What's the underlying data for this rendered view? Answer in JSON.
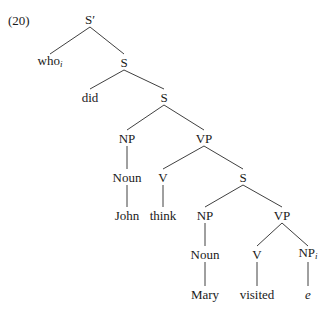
{
  "example_number": "(20)",
  "tree": {
    "nodes": [
      {
        "id": "n0",
        "label": "S′",
        "sub": "",
        "italic": false,
        "x": 90,
        "y": 19
      },
      {
        "id": "n1",
        "label": "who",
        "sub": "i",
        "italic": false,
        "x": 50,
        "y": 62
      },
      {
        "id": "n2",
        "label": "S",
        "sub": "",
        "italic": false,
        "x": 124,
        "y": 62
      },
      {
        "id": "n3",
        "label": "did",
        "sub": "",
        "italic": false,
        "x": 90,
        "y": 97
      },
      {
        "id": "n4",
        "label": "S",
        "sub": "",
        "italic": false,
        "x": 164,
        "y": 97
      },
      {
        "id": "n5",
        "label": "NP",
        "sub": "",
        "italic": false,
        "x": 127,
        "y": 138
      },
      {
        "id": "n6",
        "label": "VP",
        "sub": "",
        "italic": false,
        "x": 204,
        "y": 138
      },
      {
        "id": "n7",
        "label": "Noun",
        "sub": "",
        "italic": false,
        "x": 127,
        "y": 177
      },
      {
        "id": "n8",
        "label": "V",
        "sub": "",
        "italic": false,
        "x": 163,
        "y": 177
      },
      {
        "id": "n9",
        "label": "S",
        "sub": "",
        "italic": false,
        "x": 243,
        "y": 177
      },
      {
        "id": "n10",
        "label": "John",
        "sub": "",
        "italic": false,
        "x": 127,
        "y": 215
      },
      {
        "id": "n11",
        "label": "think",
        "sub": "",
        "italic": false,
        "x": 163,
        "y": 215
      },
      {
        "id": "n12",
        "label": "NP",
        "sub": "",
        "italic": false,
        "x": 205,
        "y": 215
      },
      {
        "id": "n13",
        "label": "VP",
        "sub": "",
        "italic": false,
        "x": 282,
        "y": 215
      },
      {
        "id": "n14",
        "label": "Noun",
        "sub": "",
        "italic": false,
        "x": 205,
        "y": 254
      },
      {
        "id": "n15",
        "label": "V",
        "sub": "",
        "italic": false,
        "x": 257,
        "y": 254
      },
      {
        "id": "n16",
        "label": "NP",
        "sub": "i",
        "italic": false,
        "x": 308,
        "y": 254
      },
      {
        "id": "n17",
        "label": "Mary",
        "sub": "",
        "italic": false,
        "x": 205,
        "y": 294
      },
      {
        "id": "n18",
        "label": "visited",
        "sub": "",
        "italic": false,
        "x": 257,
        "y": 294
      },
      {
        "id": "n19",
        "label": "e",
        "sub": "",
        "italic": true,
        "x": 308,
        "y": 294
      }
    ],
    "edges": [
      [
        "n0",
        "n1"
      ],
      [
        "n0",
        "n2"
      ],
      [
        "n2",
        "n3"
      ],
      [
        "n2",
        "n4"
      ],
      [
        "n4",
        "n5"
      ],
      [
        "n4",
        "n6"
      ],
      [
        "n5",
        "n7"
      ],
      [
        "n7",
        "n10"
      ],
      [
        "n6",
        "n8"
      ],
      [
        "n6",
        "n9"
      ],
      [
        "n8",
        "n11"
      ],
      [
        "n9",
        "n12"
      ],
      [
        "n9",
        "n13"
      ],
      [
        "n12",
        "n14"
      ],
      [
        "n14",
        "n17"
      ],
      [
        "n13",
        "n15"
      ],
      [
        "n13",
        "n16"
      ],
      [
        "n15",
        "n18"
      ],
      [
        "n16",
        "n19"
      ]
    ]
  }
}
